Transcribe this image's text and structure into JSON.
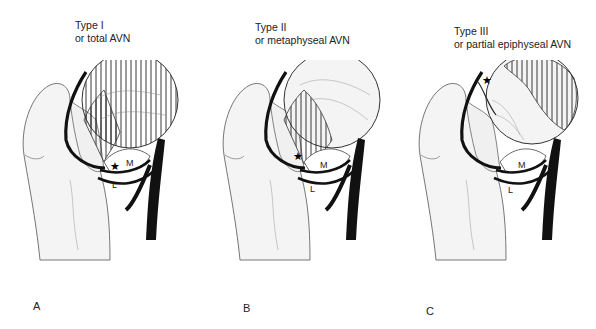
{
  "figure": {
    "panels": [
      {
        "letter": "A",
        "title_line1": "Type I",
        "title_line2": "or total AVN",
        "necrosis_region": "entire femoral head",
        "markers": {
          "star": "junction of medial/lateral vessels",
          "M": "M",
          "L": "L"
        }
      },
      {
        "letter": "B",
        "title_line1": "Type II",
        "title_line2": "or metaphyseal AVN",
        "necrosis_region": "metaphyseal (neck) region",
        "markers": {
          "star": "lateral neck",
          "M": "M",
          "L": "L"
        }
      },
      {
        "letter": "C",
        "title_line1": "Type III",
        "title_line2": "or partial epiphyseal AVN",
        "necrosis_region": "lateral/superior epiphysis",
        "markers": {
          "star": "superior epiphysis",
          "M": "M",
          "L": "L"
        }
      }
    ],
    "colors": {
      "bone_fill": "#f4f4f4",
      "outline": "#555555",
      "vessel": "#111111",
      "hatch": "#222222",
      "background": "#ffffff"
    }
  }
}
